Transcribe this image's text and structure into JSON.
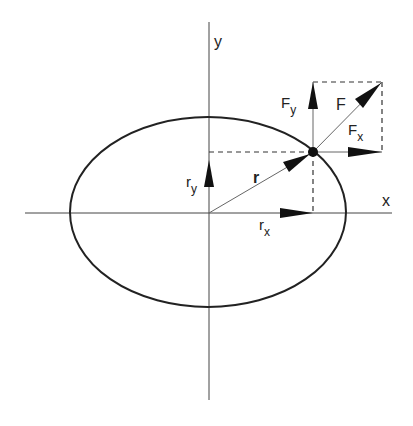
{
  "diagram": {
    "axes": {
      "x_label": "x",
      "y_label": "y"
    },
    "vectors": {
      "r": "r",
      "r_x": {
        "main": "r",
        "sub": "x"
      },
      "r_y": {
        "main": "r",
        "sub": "y"
      },
      "F": "F",
      "F_x": {
        "main": "F",
        "sub": "x"
      },
      "F_y": {
        "main": "F",
        "sub": "y"
      }
    },
    "colors": {
      "stroke": "#222222",
      "background": "#ffffff"
    }
  }
}
